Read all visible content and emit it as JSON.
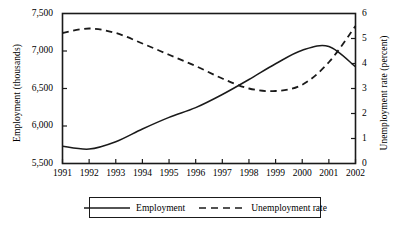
{
  "chart_data": {
    "type": "line",
    "title": "",
    "subtitle": "",
    "xlabel": "",
    "ylabel": "Employment (thousands)",
    "y2label": "Unemployment rate (percent)",
    "grid": false,
    "legend_position": "bottom-center",
    "x": [
      1991,
      1992,
      1993,
      1994,
      1995,
      1996,
      1997,
      1998,
      1999,
      2000,
      2001,
      2002
    ],
    "categories": [
      "1991",
      "1992",
      "1993",
      "1994",
      "1995",
      "1996",
      "1997",
      "1998",
      "1999",
      "2000",
      "2001",
      "2002"
    ],
    "xlim": [
      1991,
      2002
    ],
    "ylim": [
      5500,
      7500
    ],
    "y2lim": [
      0,
      6
    ],
    "yticks": [
      5500,
      6000,
      6500,
      7000,
      7500
    ],
    "ytick_labels": [
      "5,500",
      "6,000",
      "6,500",
      "7,000",
      "7,500"
    ],
    "y2ticks": [
      0,
      1,
      2,
      3,
      4,
      5,
      6
    ],
    "y2tick_labels": [
      "0",
      "1",
      "2",
      "3",
      "4",
      "5",
      "6"
    ],
    "series": [
      {
        "name": "Employment",
        "axis": "left",
        "style": "solid",
        "color": "#1a1a1a",
        "values": [
          5730,
          5692,
          5790,
          5960,
          6115,
          6245,
          6420,
          6620,
          6830,
          7010,
          7060,
          6790
        ]
      },
      {
        "name": "Unemployment rate",
        "axis": "right",
        "style": "dashed",
        "color": "#1a1a1a",
        "values": [
          5.22,
          5.4,
          5.22,
          4.8,
          4.35,
          3.9,
          3.4,
          3.0,
          2.9,
          3.15,
          4.05,
          5.5
        ]
      }
    ]
  },
  "legend": {
    "entries": [
      {
        "label": "Employment",
        "style": "solid"
      },
      {
        "label": "Unemployment rate",
        "style": "dashed"
      }
    ]
  },
  "axes": {
    "frame_color": "#1a1a1a"
  }
}
